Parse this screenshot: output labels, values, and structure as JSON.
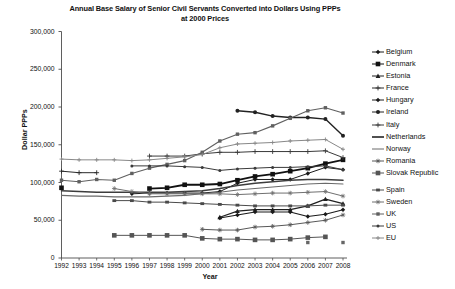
{
  "chart_data": {
    "type": "line",
    "title": "Annual Base Salary of Senior Civil Servants Converted into Dollars Using PPPs",
    "title_line2": "at 2000 Prices",
    "xlabel": "Year",
    "ylabel": "Dollar PPPs",
    "grid": false,
    "legend_position": "right",
    "xlim": [
      1992,
      2008
    ],
    "ylim": [
      0,
      300000
    ],
    "ytick_labels": [
      "300,000",
      "250,000",
      "200,000",
      "150,000",
      "100,000",
      "50,000",
      "0"
    ],
    "ytick_values": [
      300000,
      250000,
      200000,
      150000,
      100000,
      50000,
      0
    ],
    "categories": [
      1992,
      1993,
      1994,
      1995,
      1996,
      1997,
      1998,
      1999,
      2000,
      2001,
      2002,
      2003,
      2004,
      2005,
      2006,
      2007,
      2008
    ],
    "xtick_labels": [
      "1992",
      "1993",
      "1994",
      "1995",
      "1996",
      "1997",
      "1998",
      "1999",
      "2000",
      "2001",
      "2002",
      "2003",
      "2004",
      "2005",
      "2006",
      "2007",
      "2008"
    ],
    "series": [
      {
        "name": "Belgium",
        "marker": "diamond",
        "color": "#1a1a1a",
        "width": 1.0,
        "values": [
          null,
          null,
          null,
          null,
          85000,
          86000,
          86000,
          86000,
          86000,
          88000,
          99000,
          104000,
          104000,
          104000,
          112000,
          120000,
          117000
        ]
      },
      {
        "name": "Denmark",
        "marker": "square",
        "color": "#111111",
        "width": 1.8,
        "values": [
          93000,
          null,
          null,
          null,
          null,
          92000,
          93000,
          97000,
          97000,
          98000,
          103000,
          108000,
          111000,
          115000,
          119000,
          125000,
          130000
        ]
      },
      {
        "name": "Estonia",
        "marker": "triangle",
        "color": "#1f1f1f",
        "width": 1.2,
        "values": [
          null,
          null,
          null,
          null,
          null,
          null,
          null,
          null,
          null,
          54000,
          62000,
          64000,
          64000,
          64000,
          69000,
          78000,
          72000
        ]
      },
      {
        "name": "France",
        "marker": "cross",
        "color": "#2a2a2a",
        "width": 1.0,
        "values": [
          115000,
          113000,
          113000,
          null,
          null,
          null,
          null,
          null,
          null,
          null,
          null,
          null,
          null,
          null,
          null,
          null,
          null
        ]
      },
      {
        "name": "Hungary",
        "marker": "diamond",
        "color": "#1a1a1a",
        "width": 1.1,
        "values": [
          null,
          null,
          null,
          null,
          null,
          null,
          null,
          null,
          null,
          53000,
          57000,
          61000,
          61000,
          61000,
          55000,
          58000,
          64000
        ]
      },
      {
        "name": "Ireland",
        "marker": "circle",
        "color": "#222222",
        "width": 1.4,
        "values": [
          null,
          null,
          null,
          null,
          null,
          null,
          null,
          null,
          null,
          null,
          195000,
          193000,
          188000,
          186000,
          186000,
          184000,
          162000
        ]
      },
      {
        "name": "Italy",
        "marker": "plus",
        "color": "#3a3a3a",
        "width": 1.0,
        "values": [
          null,
          null,
          null,
          null,
          null,
          135000,
          135000,
          135000,
          138000,
          140000,
          140000,
          141000,
          141000,
          141000,
          141000,
          142000,
          133000
        ]
      },
      {
        "name": "Netherlands",
        "marker": "none",
        "color": "#3d3d3d",
        "width": 1.6,
        "values": [
          89000,
          88000,
          87000,
          87000,
          87000,
          87000,
          87000,
          88000,
          89000,
          92000,
          96000,
          99000,
          101000,
          103000,
          104000,
          104000,
          103000
        ]
      },
      {
        "name": "Norway",
        "marker": "none",
        "color": "#6a6a6a",
        "width": 1.1,
        "values": [
          83000,
          82000,
          82000,
          81000,
          81000,
          81000,
          82000,
          83000,
          85000,
          87000,
          90000,
          92000,
          94000,
          96000,
          98000,
          99000,
          98000
        ]
      },
      {
        "name": "Romania",
        "marker": "star",
        "color": "#585858",
        "width": 1.0,
        "values": [
          null,
          null,
          null,
          null,
          null,
          null,
          null,
          null,
          38000,
          37000,
          37000,
          41000,
          42000,
          44000,
          47000,
          50000,
          57000
        ]
      },
      {
        "name": "Slovak Republic",
        "marker": "square",
        "color": "#555555",
        "width": 1.0,
        "values": [
          null,
          null,
          null,
          30000,
          30000,
          30000,
          30000,
          30000,
          26000,
          25000,
          25000,
          24000,
          24000,
          25000,
          27000,
          28000,
          null
        ]
      },
      {
        "name": "Spain",
        "marker": "dash-dot",
        "color": "#4a4a4a",
        "width": 1.0,
        "values": [
          null,
          null,
          null,
          76000,
          76000,
          74000,
          74000,
          73000,
          72000,
          71000,
          70000,
          69000,
          69000,
          69000,
          69000,
          70000,
          70000
        ]
      },
      {
        "name": "Sweden",
        "marker": "star",
        "color": "#707070",
        "width": 1.0,
        "values": [
          null,
          null,
          null,
          92000,
          88000,
          85000,
          85000,
          85000,
          85000,
          85000,
          84000,
          85000,
          86000,
          86000,
          87000,
          88000,
          82000
        ]
      },
      {
        "name": "UK",
        "marker": "square-sm",
        "color": "#606060",
        "width": 1.1,
        "values": [
          103000,
          101000,
          104000,
          103000,
          112000,
          119000,
          124000,
          129000,
          140000,
          155000,
          164000,
          166000,
          175000,
          185000,
          195000,
          199000,
          192000
        ]
      },
      {
        "name": "US",
        "marker": "circle-sm",
        "color": "#3a3a3a",
        "width": 1.0,
        "values": [
          null,
          null,
          null,
          null,
          122000,
          122000,
          122000,
          121000,
          120000,
          116000,
          118000,
          119000,
          120000,
          120000,
          121000,
          122000,
          117000
        ]
      },
      {
        "name": "EU",
        "marker": "cross-sm",
        "color": "#888888",
        "width": 1.0,
        "values": [
          131000,
          130000,
          130000,
          130000,
          129000,
          130000,
          132000,
          134000,
          137000,
          146000,
          151000,
          152000,
          153000,
          155000,
          156000,
          157000,
          144000
        ]
      },
      {
        "name": "scatter-low",
        "marker": "square-sm",
        "color": "#666666",
        "width": 0,
        "values": [
          null,
          null,
          null,
          null,
          null,
          null,
          null,
          null,
          null,
          null,
          null,
          null,
          null,
          null,
          20500,
          null,
          20500
        ]
      }
    ]
  },
  "legend": {
    "items": [
      {
        "label": "Belgium",
        "marker": "diamond",
        "color": "#1a1a1a"
      },
      {
        "label": "Denmark",
        "marker": "square",
        "color": "#111111"
      },
      {
        "label": "Estonia",
        "marker": "triangle",
        "color": "#1f1f1f"
      },
      {
        "label": "France",
        "marker": "cross",
        "color": "#2a2a2a"
      },
      {
        "label": "Hungary",
        "marker": "diamond",
        "color": "#1a1a1a"
      },
      {
        "label": "Ireland",
        "marker": "circle",
        "color": "#222222"
      },
      {
        "label": "Italy",
        "marker": "plus",
        "color": "#3a3a3a"
      },
      {
        "label": "Netherlands",
        "marker": "none",
        "color": "#3d3d3d"
      },
      {
        "label": "Norway",
        "marker": "none",
        "color": "#6a6a6a"
      },
      {
        "label": "Romania",
        "marker": "star",
        "color": "#585858"
      },
      {
        "label": "Slovak Republic",
        "marker": "square",
        "color": "#555555"
      },
      {
        "label": "Spain",
        "marker": "dash-dot",
        "color": "#4a4a4a"
      },
      {
        "label": "Sweden",
        "marker": "star",
        "color": "#707070"
      },
      {
        "label": "UK",
        "marker": "square-sm",
        "color": "#606060"
      },
      {
        "label": "US",
        "marker": "circle-sm",
        "color": "#3a3a3a"
      },
      {
        "label": "EU",
        "marker": "cross-sm",
        "color": "#888888"
      }
    ]
  },
  "colors": {
    "axis": "#4d4d4d",
    "text": "#111111",
    "background": "#ffffff"
  }
}
